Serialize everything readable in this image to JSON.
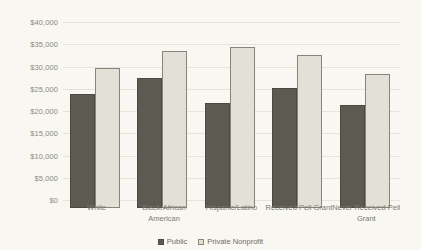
{
  "chart_data": {
    "type": "bar",
    "title": "",
    "xlabel": "",
    "ylabel": "",
    "ylim": [
      0,
      40000
    ],
    "ytick_step": 5000,
    "grid": true,
    "legend_position": "bottom-center",
    "categories": [
      "White",
      "Black/African American",
      "Hispanic/Latino",
      "Received Pell Grant",
      "Never Received Pell Grant"
    ],
    "ytick_labels": [
      "$40,000",
      "$35,000",
      "$30,000",
      "$25,000",
      "$20,000",
      "$15,000",
      "$10,000",
      "$5,000",
      "$0"
    ],
    "ytick_values": [
      40000,
      35000,
      30000,
      25000,
      20000,
      15000,
      10000,
      5000,
      0
    ],
    "series": [
      {
        "name": "Public",
        "color": "#5c5b51",
        "values": [
          25700,
          29300,
          23700,
          26900,
          23200
        ]
      },
      {
        "name": "Private Nonprofit",
        "color": "#e2e1d8",
        "values": [
          31500,
          35200,
          36200,
          34300,
          30100
        ]
      }
    ]
  },
  "legend": {
    "items": [
      {
        "label": "Public",
        "swatch": "public"
      },
      {
        "label": "Private Nonprofit",
        "swatch": "private"
      }
    ]
  },
  "colors": {
    "background": "#f8f7f2",
    "gridline": "#e4e3dc",
    "public_bar": "#5c5b51",
    "public_bar_border": "#4b4a41",
    "private_bar": "#e2e1d8",
    "private_bar_border": "#86857a",
    "tick_text": "#8c8a7e",
    "category_text": "#7d7b70",
    "legend_text": "#6f6d63"
  }
}
